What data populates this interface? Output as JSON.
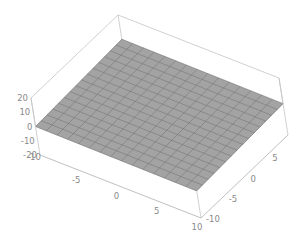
{
  "chart_data": {
    "type": "surface3d",
    "title": "",
    "xlabel": "",
    "ylabel": "",
    "zlabel": "",
    "x_range": [
      -10,
      10
    ],
    "y_range": [
      -10,
      10
    ],
    "z_range": [
      -20,
      20
    ],
    "x_ticks": [
      -10,
      -5,
      0,
      5,
      10
    ],
    "y_ticks": [
      -10,
      -5,
      0,
      5,
      10
    ],
    "z_ticks": [
      20,
      10,
      0,
      -10,
      -20
    ],
    "x_tick_labels": [
      "-10",
      "-5",
      "0",
      "5",
      "10"
    ],
    "y_tick_labels": [
      "-10",
      "-5",
      "0",
      "5",
      "10"
    ],
    "z_tick_labels": [
      "20",
      "10",
      "0",
      "-10",
      "-20"
    ],
    "mesh_divisions": 15,
    "surface_color": "#a3a3a3",
    "mesh_color": "#6f6f6f",
    "box_color": "#c4c4c4",
    "surface_corners_z": {
      "x_min_y_min": 0,
      "x_max_y_min": -1,
      "x_min_y_max": 3,
      "x_max_y_max": 2
    },
    "grid": false,
    "legend": null
  }
}
